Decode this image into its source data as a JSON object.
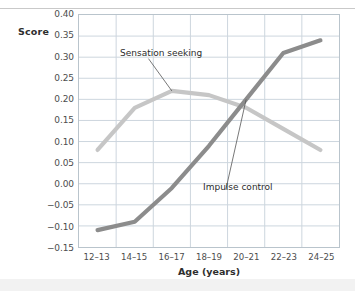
{
  "chart_data": {
    "type": "line",
    "title": "",
    "xlabel": "Age (years)",
    "ylabel": "Score",
    "categories": [
      "12–13",
      "14–15",
      "16–17",
      "18–19",
      "20–21",
      "22–23",
      "24–25"
    ],
    "ylim": [
      -0.15,
      0.4
    ],
    "yticks": [
      0.4,
      0.35,
      0.3,
      0.25,
      0.2,
      0.15,
      0.1,
      0.05,
      0.0,
      -0.05,
      -0.1,
      -0.15
    ],
    "ytick_labels": [
      "0.40",
      "0.35",
      "0.30",
      "0.25",
      "0.20",
      "0.15",
      "0.10",
      "0.05",
      "0.00",
      "−0.05",
      "−0.10",
      "−0.15"
    ],
    "grid": true,
    "legend_position": "inline-annotations",
    "series": [
      {
        "name": "Sensation seeking",
        "color": "#c6c6c6",
        "values": [
          0.08,
          0.18,
          0.22,
          0.21,
          0.18,
          0.13,
          0.08
        ]
      },
      {
        "name": "Impulse control",
        "color": "#8c8c8c",
        "values": [
          -0.11,
          -0.09,
          -0.01,
          0.09,
          0.2,
          0.31,
          0.34
        ]
      }
    ],
    "annotations": [
      {
        "text": "Sensation seeking",
        "target_series": "Sensation seeking",
        "target_category": "16–17"
      },
      {
        "text": "Impulse control",
        "target_series": "Impulse control",
        "target_category": "20–21"
      }
    ]
  },
  "style": {
    "grid_color": "#ccd6de",
    "frame_color": "#b9c4cc",
    "text_color": "#4d4d4d",
    "title_color": "#2e2e2e",
    "background": "#ffffff",
    "leader_color": "#555555"
  }
}
